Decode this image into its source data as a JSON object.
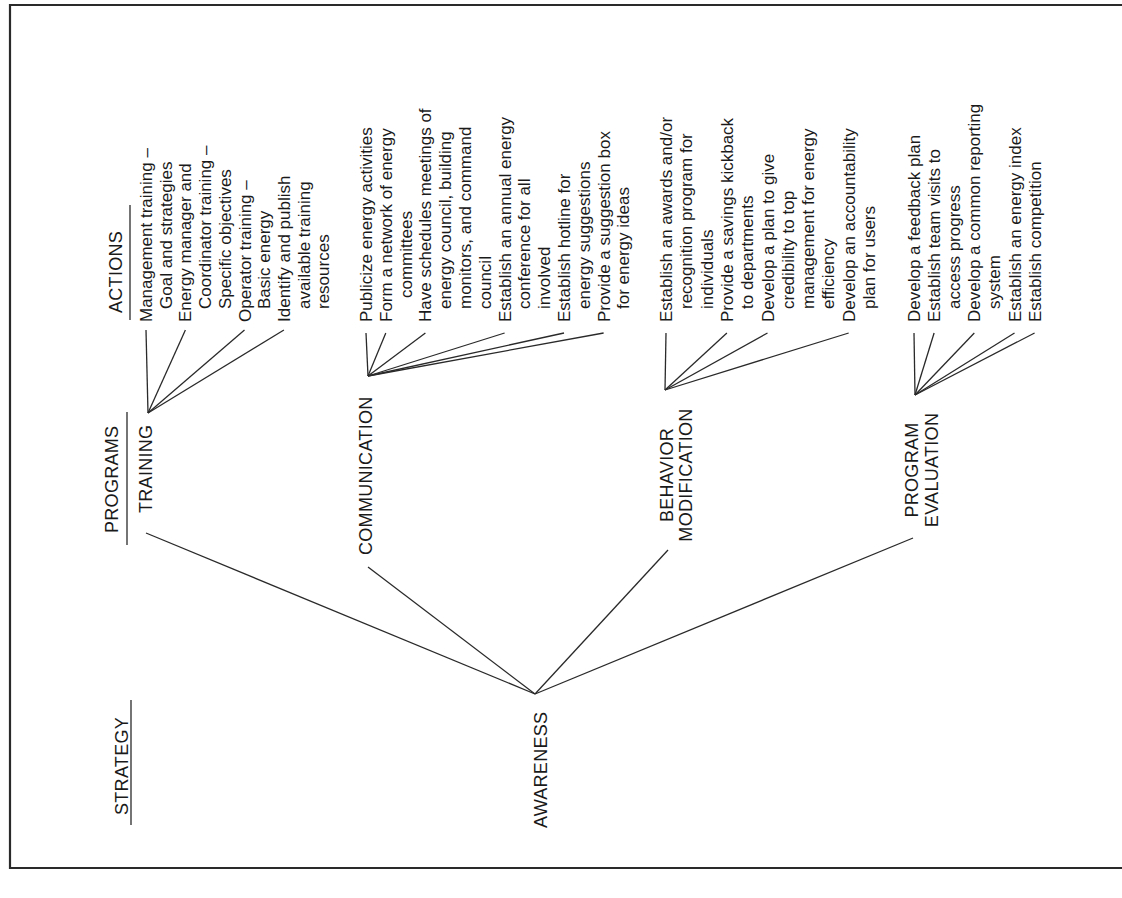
{
  "figure": {
    "orientation": "rotated-90-ccw",
    "colors": {
      "ink": "#1a1a1a",
      "background": "#ffffff"
    },
    "headers": {
      "strategy": "STRATEGY",
      "programs": "PROGRAMS",
      "actions": "ACTIONS"
    },
    "strategy": {
      "label": "AWARENESS"
    },
    "programs": [
      {
        "id": "training",
        "label_lines": [
          "TRAINING"
        ],
        "actions": [
          {
            "text": "Management training –",
            "indent": 0
          },
          {
            "text": "Goal and strategies",
            "indent": 1
          },
          {
            "text": "Energy manager and",
            "indent": 0
          },
          {
            "text": "Coordinator training –",
            "indent": 1
          },
          {
            "text": "Specific objectives",
            "indent": 1
          },
          {
            "text": "Operator training –",
            "indent": 0
          },
          {
            "text": "Basic energy",
            "indent": 1
          },
          {
            "text": "Identify and publish",
            "indent": 0
          },
          {
            "text": "available training",
            "indent": 1
          },
          {
            "text": "resources",
            "indent": 1
          }
        ]
      },
      {
        "id": "communication",
        "label_lines": [
          "COMMUNICATION"
        ],
        "actions": [
          {
            "text": "Publicize energy activities",
            "indent": 0
          },
          {
            "text": "Form a network of energy",
            "indent": 0
          },
          {
            "text": "committees",
            "indent": 2
          },
          {
            "text": "Have schedules meetings of",
            "indent": 0
          },
          {
            "text": "energy council, building",
            "indent": 1
          },
          {
            "text": "monitors, and command",
            "indent": 1
          },
          {
            "text": "council",
            "indent": 1
          },
          {
            "text": "Establish an annual energy",
            "indent": 0
          },
          {
            "text": "conference for all",
            "indent": 1
          },
          {
            "text": "involved",
            "indent": 1
          },
          {
            "text": "Establish hotline for",
            "indent": 0
          },
          {
            "text": "energy suggestions",
            "indent": 1
          },
          {
            "text": "Provide a suggestion box",
            "indent": 0
          },
          {
            "text": "for energy ideas",
            "indent": 1
          }
        ]
      },
      {
        "id": "behavior-modification",
        "label_lines": [
          "BEHAVIOR",
          "MODIFICATION"
        ],
        "actions": [
          {
            "text": "Establish an awards and/or",
            "indent": 0
          },
          {
            "text": "recognition program for",
            "indent": 1
          },
          {
            "text": "individuals",
            "indent": 1
          },
          {
            "text": "Provide a savings kickback",
            "indent": 0
          },
          {
            "text": "to departments",
            "indent": 1
          },
          {
            "text": "Develop a plan to give",
            "indent": 0
          },
          {
            "text": "credibility to top",
            "indent": 1
          },
          {
            "text": "management for energy",
            "indent": 1
          },
          {
            "text": "efficiency",
            "indent": 1
          },
          {
            "text": "Develop an accountability",
            "indent": 0
          },
          {
            "text": "plan for users",
            "indent": 1
          }
        ]
      },
      {
        "id": "program-evaluation",
        "label_lines": [
          "PROGRAM",
          "EVALUATION"
        ],
        "actions": [
          {
            "text": "Develop a feedback plan",
            "indent": 0
          },
          {
            "text": "Establish team visits to",
            "indent": 0
          },
          {
            "text": "access progress",
            "indent": 1
          },
          {
            "text": "Develop a common reporting",
            "indent": 0
          },
          {
            "text": "system",
            "indent": 1
          },
          {
            "text": "Establish an energy index",
            "indent": 0
          },
          {
            "text": "Establish competition",
            "indent": 0
          }
        ]
      }
    ]
  }
}
